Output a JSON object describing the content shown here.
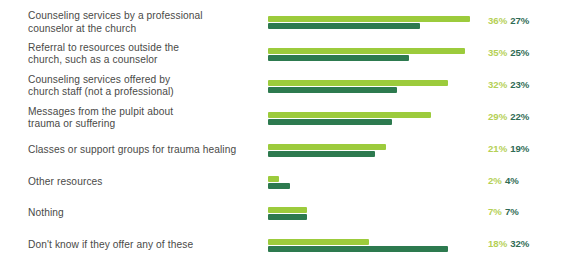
{
  "chart_data": {
    "type": "bar",
    "orientation": "horizontal",
    "title": "",
    "subtitle": "",
    "xlabel": "",
    "ylabel": "",
    "grid": false,
    "legend_position": "none",
    "value_suffix": "%",
    "xlim": [
      0,
      40
    ],
    "colors": {
      "series_light": "#9ccb3c",
      "series_dark": "#2d7a4f",
      "label_light": "#b5d055",
      "label_dark": "#2f6b55",
      "category_text": "#4a4a48",
      "background": "#ffffff"
    },
    "categories": [
      "Counseling services by a professional counselor at the church",
      "Referral to resources outside the church, such as a counselor",
      "Counseling services offered by church staff (not a professional)",
      "Messages from the pulpit about trauma or suffering",
      "Classes or support groups for trauma healing",
      "Other resources",
      "Nothing",
      "Don't know if they offer any of these"
    ],
    "category_lines": [
      [
        "Counseling services by a professional",
        "counselor at the church"
      ],
      [
        "Referral to resources outside the",
        "church, such as a counselor"
      ],
      [
        "Counseling services offered by",
        "church staff (not a professional)"
      ],
      [
        "Messages from the pulpit about",
        "trauma or suffering"
      ],
      [
        "Classes or support groups for trauma healing"
      ],
      [
        "Other resources"
      ],
      [
        "Nothing"
      ],
      [
        "Don't know if they offer any of these"
      ]
    ],
    "series": [
      {
        "name": "light",
        "values": [
          36,
          35,
          32,
          29,
          21,
          2,
          7,
          18
        ],
        "labels": [
          "36%",
          "35%",
          "32%",
          "29%",
          "21%",
          "2%",
          "7%",
          "18%"
        ]
      },
      {
        "name": "dark",
        "values": [
          27,
          25,
          23,
          22,
          19,
          4,
          7,
          32
        ],
        "labels": [
          "27%",
          "25%",
          "23%",
          "22%",
          "19%",
          "4%",
          "7%",
          "32%"
        ]
      }
    ]
  }
}
